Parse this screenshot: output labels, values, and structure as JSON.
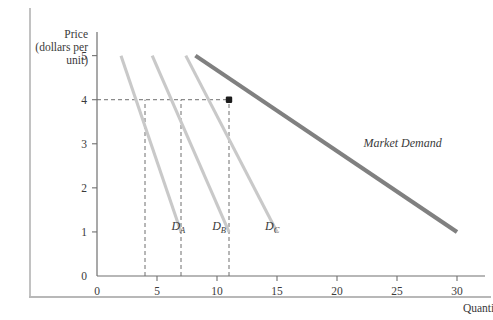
{
  "figure": {
    "y_axis_title_lines": [
      "Price",
      "(dollars per",
      "unit)"
    ],
    "x_axis_title": "Quantity"
  },
  "chart_data": {
    "type": "line",
    "title": "",
    "xlabel": "Quantity",
    "ylabel": "Price (dollars per unit)",
    "xlim": [
      0,
      31
    ],
    "ylim": [
      0,
      5.4
    ],
    "grid": false,
    "legend_position": "inline-curve-labels",
    "xticks": [
      0,
      5,
      10,
      15,
      20,
      25,
      30
    ],
    "xtick_labels": [
      "0",
      "5",
      "10",
      "15",
      "20",
      "25",
      "30"
    ],
    "yticks": [
      0,
      1,
      2,
      3,
      4,
      5
    ],
    "ytick_labels": [
      "0",
      "1",
      "2",
      "3",
      "4",
      "5"
    ],
    "series": [
      {
        "name": "D_A",
        "label": "D",
        "sublabel": "A",
        "color": "#c9c9c9",
        "style": "individual-demand",
        "points": [
          [
            2,
            5
          ],
          [
            7,
            1
          ]
        ],
        "label_pos": [
          6.2,
          1.05
        ]
      },
      {
        "name": "D_B",
        "label": "D",
        "sublabel": "B",
        "color": "#c9c9c9",
        "style": "individual-demand",
        "points": [
          [
            4.6,
            5
          ],
          [
            11,
            1
          ]
        ],
        "label_pos": [
          9.6,
          1.05
        ]
      },
      {
        "name": "D_C",
        "label": "D",
        "sublabel": "C",
        "color": "#c9c9c9",
        "style": "individual-demand",
        "points": [
          [
            7.4,
            5
          ],
          [
            15,
            1
          ]
        ],
        "label_pos": [
          14.0,
          1.05
        ]
      },
      {
        "name": "Market Demand",
        "label": "Market Demand",
        "color": "#808080",
        "style": "market-demand",
        "points": [
          [
            8.2,
            5
          ],
          [
            30,
            1
          ]
        ],
        "label_pos": [
          22.2,
          2.92
        ]
      }
    ],
    "annotations": [
      {
        "name": "equilibrium-point",
        "type": "point",
        "x": 11,
        "y": 4,
        "color": "#1c1c1c"
      },
      {
        "name": "price-guide-4",
        "type": "hline",
        "y": 4,
        "from_x": 0,
        "to_x": 11,
        "style": "dashed"
      },
      {
        "name": "quantity-guide-4",
        "type": "vline",
        "x": 4,
        "from_y": 0,
        "to_y": 4,
        "style": "dashed"
      },
      {
        "name": "quantity-guide-7",
        "type": "vline",
        "x": 7,
        "from_y": 0,
        "to_y": 4,
        "style": "dashed"
      },
      {
        "name": "quantity-guide-11",
        "type": "vline",
        "x": 11,
        "from_y": 0,
        "to_y": 4,
        "style": "dashed"
      }
    ]
  }
}
